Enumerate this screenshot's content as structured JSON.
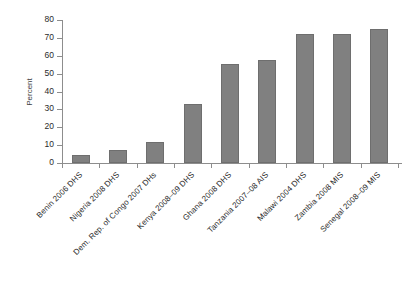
{
  "chart_data": {
    "type": "bar",
    "title": "",
    "subtitle": "",
    "xlabel": "",
    "ylabel": "Percent",
    "ylim": [
      0,
      80
    ],
    "yticks": [
      0,
      10,
      20,
      30,
      40,
      50,
      60,
      70,
      80
    ],
    "ytick_labels": [
      "0",
      "10",
      "20",
      "30",
      "40",
      "50",
      "60",
      "70",
      "80"
    ],
    "grid": false,
    "legend": null,
    "categories": [
      "Benin 2006 DHS",
      "Nigeria 2008 DHS",
      "Dem. Rep. of Congo 2007 DHs",
      "Kenya 2008–09 DHS",
      "Ghana 2008 DHS",
      "Tanzania 2007–08 AIS",
      "Malawi 2004 DHS",
      "Zambia 2008 MIS",
      "Senegal 2008–09 MIS"
    ],
    "values": [
      4.5,
      7.5,
      11.5,
      33,
      55.5,
      57.5,
      72,
      72,
      75
    ],
    "bar_color": "#808080",
    "bar_border_color": "#6e6e6e",
    "axis_color": "#8d8d8d",
    "text_color": "#2b2b2b",
    "background": "#ffffff"
  }
}
